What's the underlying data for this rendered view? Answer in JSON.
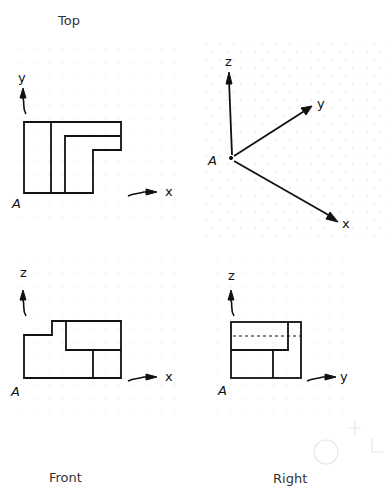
{
  "views": {
    "top": {
      "title": "Top",
      "vertical_axis": "y",
      "horizontal_axis": "x",
      "origin": "A"
    },
    "isometric": {
      "axes": [
        "z",
        "y",
        "x"
      ],
      "z_label": "z",
      "y_label": "y",
      "x_label": "x",
      "origin": "A"
    },
    "front": {
      "title": "Front",
      "vertical_axis": "z",
      "horizontal_axis": "x",
      "origin": "A"
    },
    "right": {
      "title": "Right",
      "vertical_axis": "z",
      "horizontal_axis": "y",
      "origin": "A",
      "hidden_line": "dashed"
    }
  },
  "colors": {
    "line": "#111111",
    "grid": "#e4e4e4",
    "background": "#ffffff"
  }
}
